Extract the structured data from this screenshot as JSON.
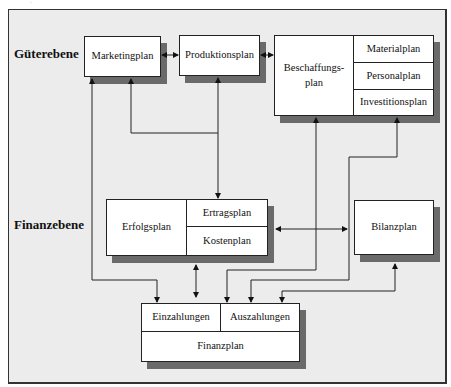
{
  "levels": {
    "goods": "Güterebene",
    "finance": "Finanzebene"
  },
  "boxes": {
    "marketing": "Marketingplan",
    "production": "Produktionsplan",
    "procurement": "Beschaffungs-\nplan",
    "material": "Materialplan",
    "personnel": "Personalplan",
    "investment": "Investitionsplan",
    "success": "Erfolgsplan",
    "revenue": "Ertragsplan",
    "cost": "Kostenplan",
    "balance": "Bilanzplan",
    "receipts": "Einzahlungen",
    "payments": "Auszahlungen",
    "financial": "Finanzplan"
  },
  "connections": [
    {
      "from": "Marketingplan",
      "to": "Produktionsplan",
      "type": "bidirectional"
    },
    {
      "from": "Produktionsplan",
      "to": "Beschaffungsplan",
      "type": "bidirectional"
    },
    {
      "from": "Einzahlungen",
      "to": "Marketingplan",
      "type": "bidirectional"
    },
    {
      "from": "Marketingplan",
      "to": "Produktionsplan/Erfolgsplan",
      "type": "branch"
    },
    {
      "from": "Produktionsplan",
      "to": "Erfolgsplan",
      "type": "bidirectional"
    },
    {
      "from": "Erfolgsplan",
      "to": "Finanzplan",
      "type": "bidirectional"
    },
    {
      "from": "Erfolgsplan",
      "to": "Bilanzplan",
      "type": "bidirectional"
    },
    {
      "from": "Beschaffungsplan",
      "to": "Auszahlungen",
      "type": "bidirectional"
    },
    {
      "from": "Investitionsplan",
      "to": "Auszahlungen",
      "type": "bidirectional"
    },
    {
      "from": "Bilanzplan",
      "to": "Auszahlungen",
      "type": "bidirectional"
    }
  ]
}
